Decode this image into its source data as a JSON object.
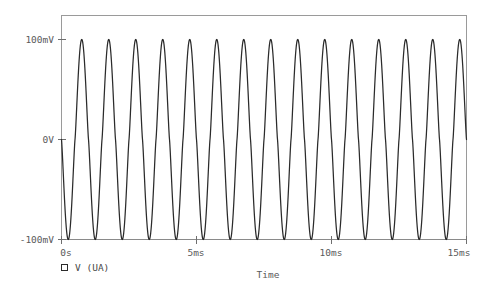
{
  "chart_data": {
    "type": "line",
    "title": "",
    "subtitle": "",
    "xlabel": "Time",
    "ylabel": "",
    "xlim": [
      0,
      15
    ],
    "xunit": "ms",
    "ylim": [
      -100,
      100
    ],
    "yunit": "mV",
    "grid": false,
    "legend_position": "bottom-left",
    "x_ticks": [
      {
        "value": 0,
        "label": "0s"
      },
      {
        "value": 5,
        "label": "5ms"
      },
      {
        "value": 10,
        "label": "10ms"
      },
      {
        "value": 15,
        "label": "15ms"
      }
    ],
    "y_ticks": [
      {
        "value": 100,
        "label": "100mV"
      },
      {
        "value": 0,
        "label": "0V"
      },
      {
        "value": -100,
        "label": "-100mV"
      }
    ],
    "series": [
      {
        "name": "V (UA)",
        "color": "#2b2b2b",
        "marker": "open-square",
        "waveform": "sine",
        "frequency_khz": 1,
        "amplitude_mv": 100,
        "offset_mv": 0,
        "phase_deg": 180,
        "cycles": 15,
        "peak_flatten": 0.22,
        "description": "1 kHz sine, 100 mV amplitude, slightly distorted (flattened) peaks, starting at 0 V going negative"
      }
    ]
  },
  "legend": {
    "entries": [
      {
        "marker": "open-square-marker",
        "label": "V (UA)"
      }
    ]
  },
  "axes": {
    "x_title": "Time",
    "y_title": ""
  }
}
